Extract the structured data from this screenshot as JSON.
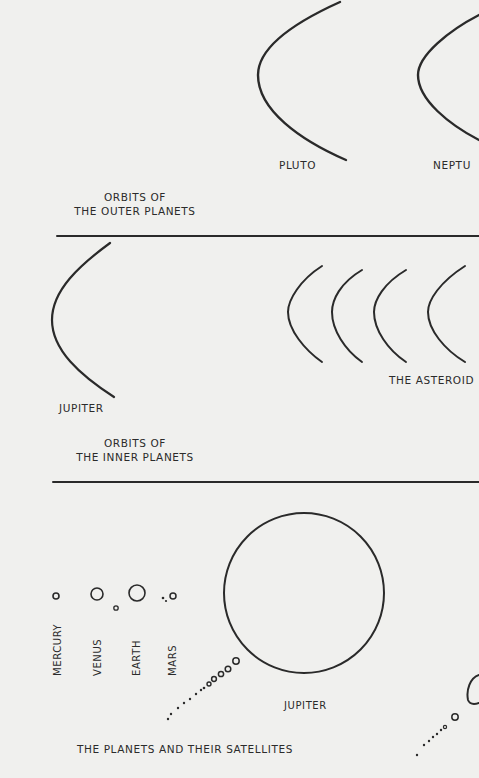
{
  "sections": {
    "outer": {
      "caption_line1": "ORBITS OF",
      "caption_line2": "THE OUTER PLANETS",
      "labels": {
        "pluto": "PLUTO",
        "neptune": "NEPTU"
      }
    },
    "inner": {
      "caption_line1": "ORBITS OF",
      "caption_line2": "THE INNER PLANETS",
      "labels": {
        "jupiter": "JUPITER",
        "asteroids": "THE ASTEROID"
      }
    },
    "planets": {
      "caption": "THE PLANETS AND THEIR SATELLITES",
      "labels": {
        "mercury": "MERCURY",
        "venus": "VENUS",
        "earth": "EARTH",
        "mars": "MARS",
        "jupiter": "JUPITER"
      }
    }
  },
  "colors": {
    "ink": "#2a2a2a",
    "paper": "#f0f0ee"
  }
}
